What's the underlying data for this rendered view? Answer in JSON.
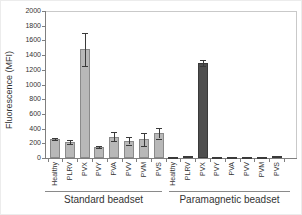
{
  "chart_data": {
    "type": "bar",
    "title": "",
    "ylabel": "Fluorescence (MFI)",
    "xlabel": "",
    "ylim": [
      0,
      2000
    ],
    "yticks": [
      0,
      200,
      400,
      600,
      800,
      1000,
      1200,
      1400,
      1600,
      1800,
      2000
    ],
    "grid": false,
    "legend": false,
    "categories": [
      "Healthy",
      "PLRV",
      "PVX",
      "PVY",
      "PVA",
      "PVV",
      "PVM",
      "PVS"
    ],
    "groups": [
      {
        "label": "Standard beadset",
        "values": [
          260,
          215,
          1480,
          150,
          290,
          230,
          255,
          335
        ],
        "errors": [
          15,
          30,
          225,
          20,
          65,
          50,
          90,
          70
        ],
        "bar_fill": "#b8b8b8",
        "bar_border": "#8a8a8a"
      },
      {
        "label": "Paramagnetic beadset",
        "values": [
          8,
          25,
          1290,
          10,
          12,
          18,
          18,
          25
        ],
        "errors": [
          0,
          0,
          40,
          0,
          0,
          0,
          0,
          0
        ],
        "bar_fill": "#4f4f4f",
        "bar_border": "#3a3a3a"
      }
    ],
    "colors": {
      "axis": "#7f7f7f",
      "plot_border": "#c9c9c9",
      "text": "#333333",
      "error_bar": "#3a3a3a",
      "background": "#ffffff"
    }
  }
}
